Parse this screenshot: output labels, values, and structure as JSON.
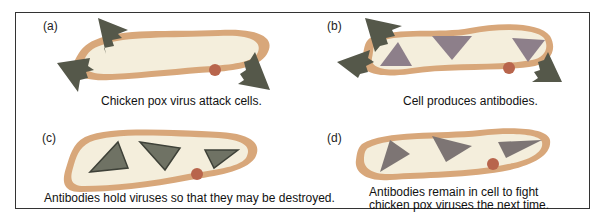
{
  "colors": {
    "membrane": "#d8a77a",
    "cytoplasm": "#f4eedc",
    "virus": "#6f7264",
    "virus_dark": "#4e5246",
    "antibody": "#8d7f8a",
    "nucleus": "#b8654c",
    "frame": "#333333"
  },
  "panels": [
    {
      "id": "a",
      "label": "(a)",
      "caption": "Chicken pox virus attack cells."
    },
    {
      "id": "b",
      "label": "(b)",
      "caption": "Cell produces antibodies."
    },
    {
      "id": "c",
      "label": "(c)",
      "caption": "Antibodies hold viruses so that they may be destroyed."
    },
    {
      "id": "d",
      "label": "(d)",
      "caption_lines": [
        "Antibodies remain in cell to fight",
        "chicken pox viruses the next time."
      ]
    }
  ]
}
